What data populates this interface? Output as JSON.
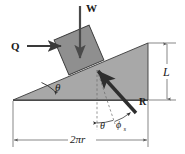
{
  "figure": {
    "type": "free-body-diagram",
    "background_color": "#ffffff",
    "incline": {
      "fill_color": "#a8a8a8",
      "edge_color": "#3a3a3a",
      "angle_label": "θ",
      "base_label": "2πr",
      "height_label": "L"
    },
    "block": {
      "fill_color": "#8f8f8f",
      "edge_color": "#3a3a3a"
    },
    "forces": [
      {
        "name": "weight",
        "label": "W",
        "direction": "down",
        "color": "#4a4a4a"
      },
      {
        "name": "applied-force",
        "label": "Q",
        "direction": "right",
        "color": "#3a3a3a"
      },
      {
        "name": "resultant-reaction",
        "label": "R",
        "direction": "up-left",
        "color": "#3a3a3a"
      }
    ],
    "angles": [
      {
        "name": "incline-angle",
        "label": "θ"
      },
      {
        "name": "incline-angle-at-normal",
        "label": "θ"
      },
      {
        "name": "friction-angle",
        "label": "ϕ",
        "subscript": "s"
      }
    ],
    "dimensions": [
      {
        "name": "height-dimension",
        "label": "L"
      },
      {
        "name": "base-dimension",
        "label": "2πr"
      }
    ]
  }
}
